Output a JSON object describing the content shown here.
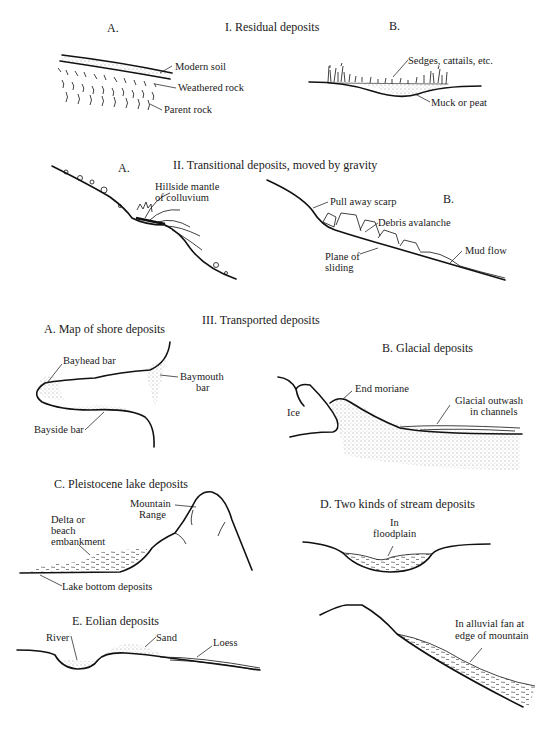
{
  "sections": {
    "residual": {
      "title": "I.  Residual deposits",
      "a": {
        "letter": "A.",
        "labels": [
          "Modern soil",
          "Weathered rock",
          "Parent rock"
        ]
      },
      "b": {
        "letter": "B.",
        "labels": [
          "Sedges, cattails, etc.",
          "Muck or peat"
        ]
      }
    },
    "transitional": {
      "title": "II.  Transitional deposits, moved by gravity",
      "a": {
        "letter": "A.",
        "labels": [
          "Hillside mantle",
          "of colluvium"
        ]
      },
      "b": {
        "letter": "B.",
        "labels": [
          "Pull away scarp",
          "Debris avalanche",
          "Plane of",
          "sliding",
          "Mud flow"
        ]
      }
    },
    "transported": {
      "title": "III.  Transported deposits",
      "a": {
        "title": "A.  Map of shore deposits",
        "labels": [
          "Bayhead bar",
          "Baymouth",
          "bar",
          "Bayside bar"
        ]
      },
      "b": {
        "title": "B.  Glacial deposits",
        "labels": [
          "End moriane",
          "Ice",
          "Glacial outwash",
          "in channels"
        ]
      },
      "c": {
        "title": "C.  Pleistocene lake deposits",
        "labels": [
          "Mountain",
          "Range",
          "Delta or",
          "beach",
          "embankment",
          "Lake bottom deposits"
        ]
      },
      "d": {
        "title": "D.  Two kinds of stream deposits",
        "labels": [
          "In",
          "floodplain",
          "In alluvial fan at",
          "edge of mountain"
        ]
      },
      "e": {
        "title": "E.  Eolian deposits",
        "labels": [
          "River",
          "Sand",
          "Loess"
        ]
      }
    }
  }
}
